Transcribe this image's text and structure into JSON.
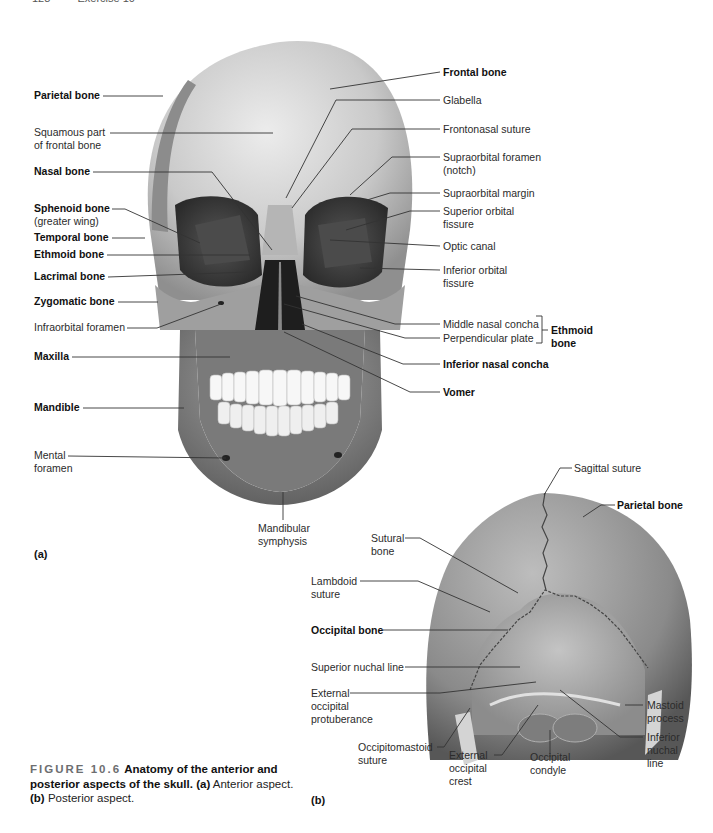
{
  "page_header": {
    "page_number": "128",
    "section": "Exercise 10"
  },
  "figure": {
    "number": "FIGURE 10.6",
    "title": "Anatomy of the anterior and posterior aspects of the skull.",
    "caption_a_marker": "(a)",
    "caption_a_text": "Anterior aspect.",
    "caption_b_marker": "(b)",
    "caption_b_text": "Posterior aspect."
  },
  "panel_a": {
    "marker": "(a)",
    "left_labels": [
      {
        "text": "Parietal bone",
        "bold": true
      },
      {
        "text": "Squamous part",
        "text2": "of frontal bone",
        "bold": false
      },
      {
        "text": "Nasal bone",
        "bold": true
      },
      {
        "text": "Sphenoid bone",
        "text2": "(greater wing)",
        "bold": true
      },
      {
        "text": "Temporal bone",
        "bold": true
      },
      {
        "text": "Ethmoid bone",
        "bold": true
      },
      {
        "text": "Lacrimal bone",
        "bold": true
      },
      {
        "text": "Zygomatic bone",
        "bold": true
      },
      {
        "text": "Infraorbital foramen",
        "bold": false
      },
      {
        "text": "Maxilla",
        "bold": true
      },
      {
        "text": "Mandible",
        "bold": true
      },
      {
        "text": "Mental",
        "text2": "foramen",
        "bold": false
      }
    ],
    "right_labels": [
      {
        "text": "Frontal bone",
        "bold": true
      },
      {
        "text": "Glabella",
        "bold": false
      },
      {
        "text": "Frontonasal suture",
        "bold": false
      },
      {
        "text": "Supraorbital foramen",
        "text2": "(notch)",
        "bold": false
      },
      {
        "text": "Supraorbital margin",
        "bold": false
      },
      {
        "text": "Superior orbital",
        "text2": "fissure",
        "bold": false
      },
      {
        "text": "Optic canal",
        "bold": false
      },
      {
        "text": "Inferior orbital",
        "text2": "fissure",
        "bold": false
      },
      {
        "text": "Middle nasal concha",
        "bold": false
      },
      {
        "text": "Perpendicular plate",
        "bold": false
      },
      {
        "text": "Inferior nasal concha",
        "bold": true
      },
      {
        "text": "Vomer",
        "bold": true
      }
    ],
    "bracket_label": {
      "text": "Ethmoid",
      "text2": "bone"
    },
    "bottom_label": {
      "text": "Mandibular",
      "text2": "symphysis"
    }
  },
  "panel_b": {
    "marker": "(b)",
    "labels": [
      {
        "text": "Sagittal suture",
        "bold": false
      },
      {
        "text": "Parietal bone",
        "bold": true
      },
      {
        "text": "Sutural",
        "text2": "bone",
        "bold": false
      },
      {
        "text": "Lambdoid",
        "text2": "suture",
        "bold": false
      },
      {
        "text": "Occipital bone",
        "bold": true
      },
      {
        "text": "Superior nuchal line",
        "bold": false
      },
      {
        "text": "External",
        "text2": "occipital",
        "text3": "protuberance",
        "bold": false
      },
      {
        "text": "Mastoid",
        "text2": "process",
        "bold": false
      },
      {
        "text": "Occipitomastoid",
        "text2": "suture",
        "bold": false
      },
      {
        "text": "External",
        "text2": "occipital",
        "text3": "crest",
        "bold": false
      },
      {
        "text": "Occipital",
        "text2": "condyle",
        "bold": false
      },
      {
        "text": "Inferior",
        "text2": "nuchal",
        "text3": "line",
        "bold": false
      }
    ]
  },
  "colors": {
    "bone_light": "#d9d9d9",
    "bone_mid": "#9a9a9a",
    "bone_dark": "#5e5e5e",
    "orbit": "#3a3a3a",
    "leader": "#333333"
  }
}
